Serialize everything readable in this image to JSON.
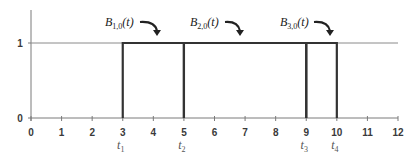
{
  "chart_data": {
    "type": "line",
    "title": "",
    "xlabel": "",
    "ylabel": "",
    "xlim": [
      0,
      12
    ],
    "ylim": [
      0,
      1
    ],
    "x_ticks": [
      0,
      1,
      2,
      3,
      4,
      5,
      6,
      7,
      8,
      9,
      10,
      11,
      12
    ],
    "y_ticks": [
      0,
      1
    ],
    "grid": false,
    "knots": [
      {
        "label": "t",
        "sub": "1",
        "x": 3
      },
      {
        "label": "t",
        "sub": "2",
        "x": 5
      },
      {
        "label": "t",
        "sub": "3",
        "x": 9
      },
      {
        "label": "t",
        "sub": "4",
        "x": 10
      }
    ],
    "series": [
      {
        "name": "B_{1,0}(t)",
        "label_main": "B",
        "label_sub": "1,0",
        "label_tail": "(t)",
        "interval": [
          3,
          5
        ],
        "value": 1
      },
      {
        "name": "B_{2,0}(t)",
        "label_main": "B",
        "label_sub": "2,0",
        "label_tail": "(t)",
        "interval": [
          5,
          9
        ],
        "value": 1
      },
      {
        "name": "B_{3,0}(t)",
        "label_main": "B",
        "label_sub": "3,0",
        "label_tail": "(t)",
        "interval": [
          9,
          10
        ],
        "value": 1
      }
    ],
    "reference_line": {
      "y": 1,
      "from": 0,
      "to": 12
    }
  },
  "colors": {
    "axis": "#7a7a7a",
    "series": "#333333",
    "reference": "#8a8a8a"
  }
}
